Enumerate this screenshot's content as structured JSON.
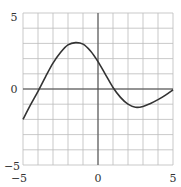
{
  "chart_data": {
    "type": "line",
    "title": "",
    "xlabel": "",
    "ylabel": "",
    "xlim": [
      -5,
      5
    ],
    "ylim": [
      -5,
      5
    ],
    "grid": true,
    "grid_step": 1,
    "x_tick_labels": [
      "-5",
      "0",
      "5"
    ],
    "y_tick_labels": [
      "5",
      "0",
      "-5"
    ],
    "series": [
      {
        "name": "f(x)",
        "x": [
          -5,
          -4.5,
          -4,
          -3.5,
          -3,
          -2.5,
          -2,
          -1.5,
          -1,
          -0.5,
          0,
          0.5,
          1,
          1.5,
          2,
          2.5,
          3,
          3.5,
          4,
          4.5,
          5
        ],
        "y": [
          -2.0,
          -1.05,
          -0.15,
          0.8,
          1.7,
          2.4,
          2.9,
          3.05,
          2.95,
          2.5,
          1.8,
          0.95,
          0.1,
          -0.55,
          -1.0,
          -1.2,
          -1.15,
          -0.95,
          -0.7,
          -0.4,
          -0.05
        ]
      }
    ],
    "colors": {
      "curve": "#333333",
      "grid": "#bbbbbb",
      "axis": "#444444"
    }
  }
}
